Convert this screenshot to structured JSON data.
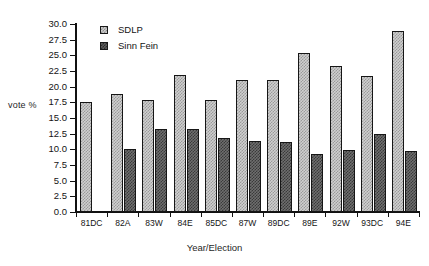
{
  "chart_data": {
    "type": "bar",
    "title": "",
    "xlabel": "Year/Election",
    "ylabel": "vote %",
    "categories": [
      "81DC",
      "82A",
      "83W",
      "84E",
      "85DC",
      "87W",
      "89DC",
      "89E",
      "92W",
      "93DC",
      "94E"
    ],
    "series": [
      {
        "name": "SDLP",
        "values": [
          17.5,
          18.9,
          17.9,
          21.9,
          17.8,
          21.0,
          21.0,
          25.4,
          23.3,
          21.7,
          28.9
        ]
      },
      {
        "name": "Sinn Fein",
        "values": [
          null,
          10.1,
          13.3,
          13.3,
          11.8,
          11.4,
          11.2,
          9.2,
          9.9,
          12.5,
          9.7
        ]
      }
    ],
    "ylim": [
      0.0,
      30.0
    ],
    "ytick_labels": [
      "30.0",
      "27.5",
      "25.0",
      "22.5",
      "20.0",
      "17.5",
      "15.0",
      "12.5",
      "10.0",
      "7.5",
      "5.0",
      "2.5",
      "0.0"
    ],
    "ytick_values": [
      30.0,
      27.5,
      25.0,
      22.5,
      20.0,
      17.5,
      15.0,
      12.5,
      10.0,
      7.5,
      5.0,
      2.5,
      0.0
    ],
    "grid": false,
    "legend_position": "top-left",
    "legend": [
      "SDLP",
      "Sinn Fein"
    ],
    "colors": {
      "sdlp": "#cfcfcf",
      "sinn_fein": "#6e6e6e",
      "axis": "#111111",
      "background": "#ffffff"
    }
  }
}
